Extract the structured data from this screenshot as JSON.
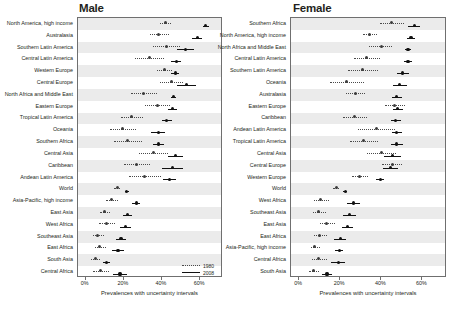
{
  "figure": {
    "xlabel": "Prevalences with uncertainty intervals",
    "legend": {
      "items": [
        {
          "label": "1980",
          "style": "dotted"
        },
        {
          "label": "2008",
          "style": "solid"
        }
      ]
    },
    "ticks": [
      {
        "label": "0%",
        "value": 0
      },
      {
        "label": "20%",
        "value": 20
      },
      {
        "label": "40%",
        "value": 40
      },
      {
        "label": "60%",
        "value": 60
      }
    ]
  },
  "chart_data": {
    "type": "scatter",
    "title": "",
    "xlabel": "Prevalences with uncertainty intervals",
    "ylabel": "",
    "xlim": [
      -4,
      72
    ],
    "grid": false,
    "legend_position": "bottom-right",
    "panels": [
      {
        "name": "Male",
        "categories": [
          "North America, high income",
          "Australasia",
          "Southern Latin America",
          "Central Latin America",
          "Western Europe",
          "Central Europe",
          "North Africa and Middle East",
          "Eastern Europe",
          "Tropical Latin America",
          "Oceania",
          "Southern Africa",
          "Central Asia",
          "Caribbean",
          "Andean Latin America",
          "World",
          "Asia-Pacific, high income",
          "East Asia",
          "West Africa",
          "Southeast Asia",
          "East Africa",
          "South Asia",
          "Central Africa"
        ],
        "series": [
          {
            "name": "1980",
            "values": [
              42.0,
              38.5,
              42.5,
              33.5,
              41.5,
              45.0,
              30.5,
              37.5,
              24.0,
              19.5,
              22.0,
              35.5,
              26.5,
              31.0,
              16.5,
              13.5,
              10.0,
              11.0,
              6.5,
              7.5,
              5.0,
              8.0
            ],
            "ci_low": [
              39.0,
              33.5,
              35.5,
              26.0,
              37.5,
              39.0,
              24.0,
              31.0,
              18.5,
              13.0,
              15.0,
              28.0,
              20.0,
              22.5,
              15.0,
              10.5,
              7.5,
              7.0,
              4.0,
              5.0,
              3.0,
              4.0
            ],
            "ci_high": [
              45.0,
              43.5,
              49.5,
              41.0,
              45.5,
              51.0,
              37.5,
              44.0,
              30.0,
              26.5,
              29.5,
              43.0,
              33.5,
              39.5,
              18.0,
              17.0,
              13.0,
              15.5,
              9.5,
              10.5,
              7.5,
              12.5
            ]
          },
          {
            "name": "2008",
            "values": [
              63.0,
              58.5,
              52.5,
              47.5,
              47.0,
              53.0,
              46.0,
              45.5,
              42.5,
              38.0,
              38.0,
              47.0,
              45.5,
              44.0,
              21.5,
              26.5,
              22.0,
              21.0,
              18.5,
              17.0,
              11.0,
              18.0
            ],
            "ci_low": [
              61.5,
              56.0,
              48.0,
              45.0,
              45.0,
              48.0,
              44.5,
              43.0,
              40.0,
              34.5,
              35.5,
              43.0,
              40.0,
              40.5,
              20.5,
              24.5,
              19.5,
              18.0,
              16.0,
              14.0,
              9.0,
              14.5
            ],
            "ci_high": [
              64.5,
              61.0,
              57.0,
              50.0,
              49.0,
              58.0,
              47.5,
              48.0,
              45.5,
              41.5,
              41.0,
              51.0,
              51.0,
              47.5,
              22.5,
              28.5,
              24.5,
              24.0,
              21.0,
              20.0,
              13.0,
              21.5
            ]
          }
        ]
      },
      {
        "name": "Female",
        "categories": [
          "Southern Africa",
          "North America, high income",
          "North Africa and Middle East",
          "Central Latin America",
          "Southern Latin America",
          "Oceania",
          "Australasia",
          "Eastern Europe",
          "Caribbean",
          "Andean Latin America",
          "Tropical Latin America",
          "Central Asia",
          "Central Europe",
          "Western Europe",
          "World",
          "West Africa",
          "Southeast Asia",
          "East Asia",
          "East Africa",
          "Asia-Pacific, high income",
          "Central Africa",
          "South Asia"
        ],
        "series": [
          {
            "name": "1980",
            "values": [
              45.0,
              34.5,
              40.0,
              33.0,
              31.0,
              23.0,
              27.5,
              46.5,
              27.0,
              37.5,
              31.5,
              40.0,
              45.5,
              29.5,
              18.0,
              10.5,
              9.5,
              13.5,
              10.0,
              7.5,
              9.5,
              7.0
            ],
            "ci_low": [
              39.5,
              31.0,
              34.0,
              26.5,
              24.0,
              15.0,
              23.0,
              42.0,
              21.5,
              28.5,
              24.5,
              33.0,
              40.5,
              25.5,
              16.5,
              7.0,
              6.5,
              10.0,
              7.0,
              5.5,
              6.0,
              5.0
            ],
            "ci_high": [
              51.0,
              38.0,
              45.0,
              39.5,
              38.5,
              31.5,
              32.0,
              51.5,
              33.0,
              46.5,
              38.5,
              47.0,
              50.0,
              33.5,
              19.5,
              14.5,
              13.0,
              17.5,
              13.5,
              10.0,
              13.5,
              9.5
            ]
          },
          {
            "name": "2008",
            "values": [
              56.0,
              54.5,
              53.0,
              53.0,
              50.5,
              49.0,
              47.5,
              48.0,
              47.0,
              47.5,
              47.5,
              45.5,
              44.5,
              39.5,
              22.5,
              26.5,
              24.5,
              23.5,
              20.0,
              19.5,
              19.0,
              13.5
            ],
            "ci_low": [
              53.0,
              52.5,
              51.5,
              51.0,
              47.5,
              45.5,
              45.0,
              45.5,
              44.5,
              45.0,
              44.5,
              41.5,
              41.0,
              37.5,
              21.5,
              23.5,
              21.5,
              21.0,
              17.0,
              17.5,
              15.5,
              11.0
            ],
            "ci_high": [
              59.0,
              56.5,
              54.5,
              55.0,
              53.5,
              52.5,
              50.0,
              50.5,
              49.5,
              50.0,
              50.5,
              49.5,
              48.0,
              41.5,
              23.5,
              29.5,
              27.5,
              26.0,
              23.0,
              21.5,
              22.5,
              16.0
            ]
          }
        ]
      }
    ]
  }
}
